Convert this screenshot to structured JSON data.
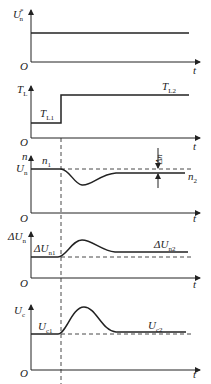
{
  "diagram": {
    "type": "timing-waveforms",
    "panels": [
      {
        "id": "speed-reference",
        "y_label": "U",
        "y_label_sub": "n",
        "y_label_sup": "*",
        "origin_label": "O",
        "x_label": "t",
        "curve_labels": []
      },
      {
        "id": "load-torque",
        "y_label": "T",
        "y_label_sub": "L",
        "origin_label": "O",
        "x_label": "t",
        "curve_labels": [
          {
            "text": "T",
            "sub": "L1"
          },
          {
            "text": "T",
            "sub": "L2"
          }
        ]
      },
      {
        "id": "speed",
        "y_label": "n",
        "y_label2": "U",
        "y_label2_sub": "n",
        "origin_label": "O",
        "x_label": "t",
        "curve_labels": [
          {
            "text": "n",
            "sub": "1"
          },
          {
            "text": "n",
            "sub": "2"
          }
        ],
        "annotation": "Δn"
      },
      {
        "id": "speed-error",
        "y_label": "ΔU",
        "y_label_sub": "n",
        "origin_label": "O",
        "x_label": "t",
        "curve_labels": [
          {
            "text": "ΔU",
            "sub": "n1"
          },
          {
            "text": "ΔU",
            "sub": "n2"
          }
        ]
      },
      {
        "id": "control-voltage",
        "y_label": "U",
        "y_label_sub": "c",
        "origin_label": "O",
        "x_label": "t",
        "curve_labels": [
          {
            "text": "U",
            "sub": "c1"
          },
          {
            "text": "U",
            "sub": "c2"
          }
        ]
      }
    ],
    "colors": {
      "line": "#222222",
      "background": "#ffffff"
    }
  }
}
